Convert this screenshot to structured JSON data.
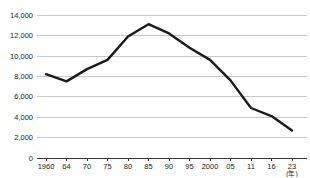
{
  "chart_data": {
    "type": "line",
    "title": "",
    "categories": [
      "1960",
      "64",
      "70",
      "75",
      "80",
      "85",
      "90",
      "95",
      "2000",
      "05",
      "11",
      "16",
      "23"
    ],
    "x_axis_unit_label": "(年)",
    "series": [
      {
        "name": "value",
        "values": [
          8200,
          7500,
          8700,
          9600,
          11900,
          13100,
          12200,
          10800,
          9600,
          7600,
          4900,
          4100,
          2700
        ]
      }
    ],
    "y_tick_labels": [
      "0",
      "2,000",
      "4,000",
      "6,000",
      "8,000",
      "10,000",
      "12,000",
      "14,000"
    ],
    "y_tick_values": [
      0,
      2000,
      4000,
      6000,
      8000,
      10000,
      12000,
      14000
    ],
    "ylim": [
      0,
      14000
    ],
    "grid": true,
    "legend": "none",
    "colors": {
      "line": "#1a1a1a",
      "grid": "#c9c9c9",
      "axis": "#333333",
      "text": "#222222",
      "background": "#ffffff"
    }
  }
}
